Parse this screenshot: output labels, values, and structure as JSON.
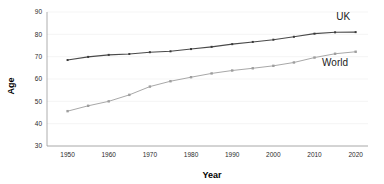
{
  "chart_data": {
    "type": "line",
    "title": "",
    "xlabel": "Year",
    "ylabel": "Age",
    "xlim": [
      1945,
      2023
    ],
    "ylim": [
      30,
      90
    ],
    "xticks": [
      1950,
      1960,
      1970,
      1980,
      1990,
      2000,
      2010,
      2020
    ],
    "yticks": [
      30,
      40,
      50,
      60,
      70,
      80,
      90
    ],
    "grid": true,
    "legend_position": "inline-right",
    "x": [
      1950,
      1955,
      1960,
      1965,
      1970,
      1975,
      1980,
      1985,
      1990,
      1995,
      2000,
      2005,
      2010,
      2015,
      2020
    ],
    "series": [
      {
        "name": "UK",
        "color": "#4a4a4a",
        "marker": "square",
        "values": [
          68.5,
          69.9,
          70.8,
          71.2,
          72.0,
          72.4,
          73.4,
          74.4,
          75.6,
          76.6,
          77.6,
          78.9,
          80.3,
          80.9,
          81.0
        ]
      },
      {
        "name": "World",
        "color": "#a8a8a8",
        "marker": "square",
        "values": [
          45.6,
          48.0,
          50.0,
          52.9,
          56.6,
          59.0,
          60.8,
          62.5,
          63.8,
          64.8,
          65.9,
          67.4,
          69.6,
          71.3,
          72.2
        ]
      }
    ],
    "annotations": [
      {
        "text": "UK",
        "x": 2017,
        "y": 86.5
      },
      {
        "text": "World",
        "x": 2015,
        "y": 66.0
      }
    ]
  },
  "axes": {
    "x_title": "Year",
    "y_title": "Age",
    "x_tick_labels": [
      "1950",
      "1960",
      "1970",
      "1980",
      "1990",
      "2000",
      "2010",
      "2020"
    ],
    "y_tick_labels": [
      "30",
      "40",
      "50",
      "60",
      "70",
      "80",
      "90"
    ]
  },
  "labels": {
    "uk": "UK",
    "world": "World"
  }
}
